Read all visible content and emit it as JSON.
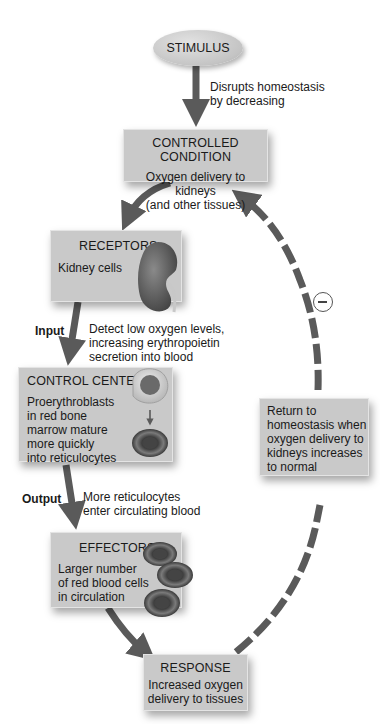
{
  "diagram": {
    "type": "negative-feedback-loop",
    "colors": {
      "box_fill": "#c9c9c9",
      "arrow": "#5a5a5a",
      "dashed_arrow": "#5a5a5a",
      "background": "#ffffff"
    },
    "stimulus": {
      "label": "STIMULUS",
      "arrow_note_line1": "Disrupts homeostasis",
      "arrow_note_line2": "by decreasing"
    },
    "controlled_condition": {
      "title": "CONTROLLED CONDITION",
      "line1": "Oxygen delivery to kidneys",
      "line2": "(and other tissues)"
    },
    "receptors": {
      "title": "RECEPTORS",
      "text": "Kidney cells",
      "icon": "kidney-icon"
    },
    "input": {
      "label": "Input",
      "note_line1": "Detect low oxygen levels,",
      "note_line2": "increasing erythropoietin",
      "note_line3": "secretion into blood"
    },
    "control_center": {
      "title": "CONTROL CENTER",
      "line1": "Proerythroblasts",
      "line2": "in red bone",
      "line3": "marrow mature",
      "line4": "more quickly",
      "line5": "into reticulocytes",
      "icons": [
        "proerythroblast-cell-icon",
        "red-blood-cell-icon"
      ]
    },
    "output": {
      "label": "Output",
      "note_line1": "More reticulocytes",
      "note_line2": "enter circulating blood"
    },
    "effectors": {
      "title": "EFFECTORS",
      "line1": "Larger number",
      "line2": "of red blood cells",
      "line3": "in circulation",
      "icon": "red-blood-cells-icon"
    },
    "response": {
      "title": "RESPONSE",
      "line1": "Increased oxygen",
      "line2": "delivery to tissues"
    },
    "feedback": {
      "sign": "−",
      "sign_meaning": "negative feedback",
      "line1": "Return to",
      "line2": "homeostasis when",
      "line3": "oxygen delivery to",
      "line4": "kidneys increases",
      "line5": "to normal"
    }
  }
}
